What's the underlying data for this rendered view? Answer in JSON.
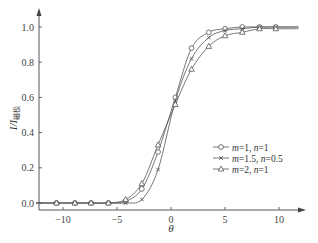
{
  "chart_data": {
    "type": "line",
    "title": "",
    "xlabel": "θ",
    "ylabel": "I/I磁极",
    "ylabel_main": "I/I",
    "ylabel_sub": "磁极",
    "xlim": [
      -12,
      12
    ],
    "ylim": [
      0,
      1.1
    ],
    "xticks": [
      -10,
      -5,
      0,
      5,
      10
    ],
    "xtick_labels": [
      "−10",
      "−5",
      "0",
      "5",
      "10"
    ],
    "yticks": [
      0.0,
      0.2,
      0.4,
      0.6,
      0.8,
      1.0
    ],
    "ytick_labels": [
      "0.0",
      "0.2",
      "0.4",
      "0.6",
      "0.8",
      "1.0"
    ],
    "grid": false,
    "legend_position": "center-right",
    "series": [
      {
        "name": "m=1, n=1",
        "label_parts": [
          "m",
          "=1, ",
          "n",
          "=1"
        ],
        "marker": "circle",
        "x": [
          -10.6,
          -8.9,
          -7.4,
          -5.8,
          -4.2,
          -2.7,
          -1.2,
          0.4,
          1.9,
          3.5,
          5.0,
          6.6,
          8.2,
          9.7
        ],
        "y": [
          0.0,
          0.0,
          0.0,
          0.0,
          0.01,
          0.08,
          0.29,
          0.6,
          0.88,
          0.97,
          0.99,
          1.0,
          1.0,
          1.0
        ]
      },
      {
        "name": "m=1.5, n=0.5",
        "label_parts": [
          "m",
          "=1.5, ",
          "n",
          "=0.5"
        ],
        "marker": "cross",
        "x": [
          -10.6,
          -8.9,
          -7.4,
          -5.8,
          -4.2,
          -2.7,
          -1.2,
          0.4,
          1.9,
          3.5,
          5.0,
          6.6,
          8.2,
          9.7
        ],
        "y": [
          0.0,
          0.0,
          0.0,
          0.0,
          0.0,
          0.02,
          0.19,
          0.58,
          0.82,
          0.94,
          0.98,
          0.99,
          1.0,
          1.0
        ]
      },
      {
        "name": "m=2, n=1",
        "label_parts": [
          "m",
          "=2, ",
          "n",
          "=1"
        ],
        "marker": "triangle",
        "x": [
          -10.6,
          -8.9,
          -7.4,
          -5.8,
          -4.2,
          -2.7,
          -1.2,
          0.4,
          1.9,
          3.5,
          5.0,
          6.6,
          8.2,
          9.7
        ],
        "y": [
          0.0,
          0.0,
          0.0,
          0.0,
          0.02,
          0.11,
          0.33,
          0.56,
          0.76,
          0.89,
          0.95,
          0.97,
          0.99,
          0.99
        ]
      }
    ]
  },
  "layout": {
    "x0_px": 171,
    "px_per_x": 10.8,
    "y0_px": 203,
    "px_per_y": 176,
    "axis_x_y": 210,
    "axis_y_x": 39,
    "colors": {
      "line": "#555555",
      "axis": "#444444",
      "text": "#333333"
    }
  }
}
